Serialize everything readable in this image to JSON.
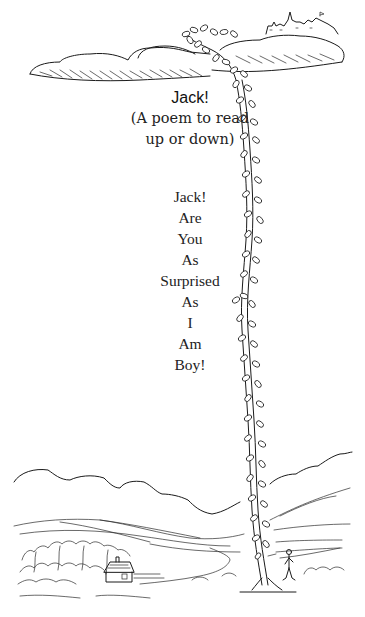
{
  "title": "Jack!",
  "subtitle": {
    "line1": "(A poem to read",
    "line2": "up or down)"
  },
  "poem": {
    "lines": [
      "Jack!",
      "Are",
      "You",
      "As",
      "Surprised",
      "As",
      "I",
      "Am",
      "Boy!"
    ]
  },
  "illustration": {
    "description": "Line drawing of a giant beanstalk rising from a countryside valley with a cottage and a boy, up through the page to a castle on the clouds",
    "elements": [
      "clouds",
      "castle",
      "beanstalk",
      "hills",
      "cottage",
      "boy"
    ],
    "stroke_color": "#1a1a1a",
    "background_color": "#ffffff"
  }
}
